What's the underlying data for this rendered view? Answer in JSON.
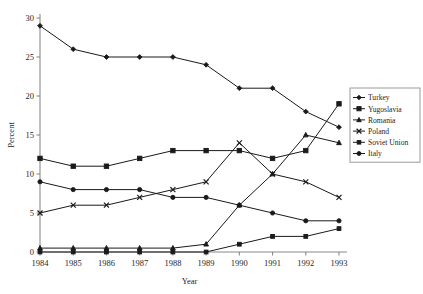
{
  "chart_data": {
    "type": "line",
    "title": "",
    "xlabel": "Year",
    "ylabel": "Percent",
    "x": [
      1984,
      1985,
      1986,
      1987,
      1988,
      1989,
      1990,
      1991,
      1992,
      1993
    ],
    "xtick_labels": [
      "1984",
      "1985",
      "1986",
      "1987",
      "1988",
      "1989",
      "1990",
      "1991",
      "1992",
      "1993"
    ],
    "ytick_labels": [
      "0",
      "5",
      "10",
      "15",
      "20",
      "25",
      "30"
    ],
    "yticks": [
      0,
      5,
      10,
      15,
      20,
      25,
      30
    ],
    "ylim": [
      0,
      30
    ],
    "xlim": [
      1984,
      1993
    ],
    "grid": false,
    "legend_position": "right",
    "series": [
      {
        "name": "Turkey",
        "marker": "diamond",
        "values": [
          29,
          26,
          25,
          25,
          25,
          24,
          21,
          21,
          18,
          16
        ]
      },
      {
        "name": "Yugoslavia",
        "marker": "square",
        "values": [
          12,
          11,
          11,
          12,
          13,
          13,
          13,
          12,
          13,
          19
        ]
      },
      {
        "name": "Romania",
        "marker": "triangle",
        "values": [
          0.5,
          0.5,
          0.5,
          0.5,
          0.5,
          1,
          6,
          10,
          15,
          14
        ]
      },
      {
        "name": "Poland",
        "marker": "cross",
        "values": [
          5,
          6,
          6,
          7,
          8,
          9,
          14,
          10,
          9,
          7
        ]
      },
      {
        "name": "Soviet Union",
        "marker": "square-small",
        "values": [
          0,
          0,
          0,
          0,
          0,
          0,
          1,
          2,
          2,
          3
        ]
      },
      {
        "name": "Italy",
        "marker": "circle",
        "values": [
          9,
          8,
          8,
          8,
          7,
          7,
          6,
          5,
          4,
          4
        ]
      }
    ]
  },
  "legend": {
    "items": [
      {
        "label": "Turkey"
      },
      {
        "label": "Yugoslavia"
      },
      {
        "label": "Romania"
      },
      {
        "label": "Poland"
      },
      {
        "label": "Soviet Union"
      },
      {
        "label": "Italy"
      }
    ]
  },
  "colors": {
    "ink": "#1a1a1a",
    "axis": "#8a8a8a",
    "background": "#ffffff"
  }
}
